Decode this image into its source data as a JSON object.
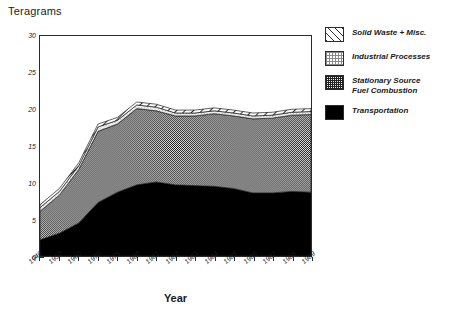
{
  "chart_data": {
    "type": "area",
    "title": "Teragrams",
    "xlabel": "Year",
    "ylabel": "Teragrams",
    "ylim": [
      0,
      30
    ],
    "ytick_values": [
      0,
      5,
      10,
      15,
      20,
      25,
      30
    ],
    "ytick_labels": [
      "0",
      "5",
      "10",
      "15",
      "20",
      "25",
      "30"
    ],
    "yminor_step": 1,
    "grid": false,
    "stacked": true,
    "legend_position": "right",
    "categories": [
      "1940",
      "1950",
      "1960",
      "1970",
      "1975",
      "1980",
      "1981",
      "1982",
      "1983",
      "1984",
      "1985",
      "1986",
      "1987",
      "1988",
      "1989"
    ],
    "series": [
      {
        "name": "Transportation",
        "swatch": "sw-transport",
        "color": "#000000",
        "values": [
          2.2,
          3.1,
          4.5,
          7.3,
          8.7,
          9.7,
          10.1,
          9.7,
          9.6,
          9.5,
          9.2,
          8.6,
          8.6,
          8.8,
          8.7
        ]
      },
      {
        "name": "Stationary Source Fuel Combustion",
        "name_line1": "Stationary Source",
        "name_line2": "Fuel Combustion",
        "swatch": "sw-stationary",
        "color": "#6f6f6f",
        "values": [
          3.9,
          5.2,
          7.3,
          9.7,
          9.3,
          10.4,
          9.7,
          9.4,
          9.5,
          9.9,
          9.9,
          10.1,
          10.2,
          10.4,
          10.6
        ]
      },
      {
        "name": "Industrial Processes",
        "swatch": "sw-industrial",
        "color": "#c9c9c9",
        "values": [
          0.5,
          0.5,
          0.5,
          0.6,
          0.5,
          0.5,
          0.5,
          0.4,
          0.4,
          0.4,
          0.4,
          0.4,
          0.4,
          0.4,
          0.4
        ]
      },
      {
        "name": "Solid Waste + Misc.",
        "swatch": "sw-solidwaste",
        "color": "#ffffff",
        "values": [
          0.4,
          0.4,
          0.4,
          0.4,
          0.4,
          0.4,
          0.4,
          0.4,
          0.4,
          0.4,
          0.4,
          0.4,
          0.4,
          0.4,
          0.4
        ]
      }
    ],
    "totals": [
      7.0,
      9.2,
      12.7,
      18.0,
      18.9,
      21.0,
      20.7,
      19.9,
      19.9,
      20.2,
      19.9,
      19.5,
      19.6,
      20.0,
      20.1
    ]
  },
  "legend": {
    "entries": [
      {
        "label": "Solid Waste + Misc."
      },
      {
        "label": "Industrial Processes"
      },
      {
        "label": "Stationary Source"
      },
      {
        "label": "Fuel Combustion"
      },
      {
        "label": "Transportation"
      }
    ]
  }
}
